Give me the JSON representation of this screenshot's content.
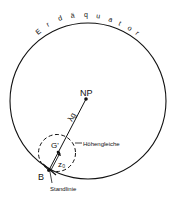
{
  "diagram": {
    "equator_label": "Erdäquator",
    "equator_letters": [
      "E",
      "r",
      "d",
      "ä",
      "q",
      "u",
      "a",
      "t",
      "o",
      "r"
    ],
    "north_pole_label": "NP",
    "geo_point_label": "G'",
    "distance_label": "λg",
    "zenith_distance_label": "z₀",
    "circle_of_equal_altitude_label": "Höhengleiche",
    "observer_label": "B",
    "line_of_position_label": "Standlinie"
  }
}
